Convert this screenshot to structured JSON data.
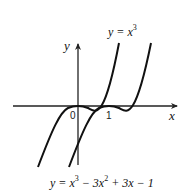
{
  "diagram": {
    "axes": {
      "x_label": "x",
      "y_label": "y",
      "origin_label": "0",
      "tick_labels": [
        "1"
      ]
    },
    "curves": [
      {
        "name": "cubic",
        "label_prefix": "y = x",
        "label_exp": "3",
        "equation": "y = x^3"
      },
      {
        "name": "shifted-cubic",
        "equation": "y = x^3 - 3x^2 + 3x - 1",
        "label_parts": {
          "p1": "y = x",
          "e1": "3",
          "p2": " − 3x",
          "e2": "2",
          "p3": " + 3x − 1"
        }
      }
    ],
    "colors": {
      "stroke": "#111111",
      "background": "#ffffff"
    }
  }
}
